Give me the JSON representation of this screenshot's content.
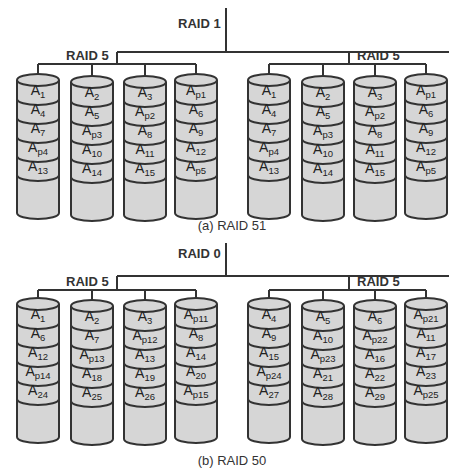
{
  "diagrams": [
    {
      "caption": "(a) RAID 51",
      "top_label": "RAID 1",
      "groups": [
        {
          "label": "RAID 5",
          "disks": [
            [
              "1",
              "4",
              "7",
              "p4",
              "13"
            ],
            [
              "2",
              "5",
              "p3",
              "10",
              "14"
            ],
            [
              "3",
              "p2",
              "8",
              "11",
              "15"
            ],
            [
              "p1",
              "6",
              "9",
              "12",
              "p5"
            ]
          ]
        },
        {
          "label": "RAID 5",
          "disks": [
            [
              "1",
              "4",
              "7",
              "p4",
              "13"
            ],
            [
              "2",
              "5",
              "p3",
              "10",
              "14"
            ],
            [
              "3",
              "p2",
              "8",
              "11",
              "15"
            ],
            [
              "p1",
              "6",
              "9",
              "12",
              "p5"
            ]
          ]
        }
      ]
    },
    {
      "caption": "(b) RAID 50",
      "top_label": "RAID 0",
      "groups": [
        {
          "label": "RAID 5",
          "disks": [
            [
              "1",
              "6",
              "12",
              "p14",
              "24"
            ],
            [
              "2",
              "7",
              "p13",
              "18",
              "25"
            ],
            [
              "3",
              "p12",
              "13",
              "19",
              "26"
            ],
            [
              "p11",
              "8",
              "14",
              "20",
              "p15"
            ]
          ]
        },
        {
          "label": "RAID 5",
          "disks": [
            [
              "4",
              "9",
              "15",
              "p24",
              "27"
            ],
            [
              "5",
              "10",
              "p23",
              "21",
              "28"
            ],
            [
              "6",
              "p22",
              "16",
              "22",
              "29"
            ],
            [
              "p21",
              "11",
              "17",
              "23",
              "p25"
            ]
          ]
        }
      ]
    }
  ],
  "block_prefix": "A",
  "colors": {
    "disk_fill": "#d6d6d6",
    "stroke": "#333333",
    "text": "#222222"
  }
}
